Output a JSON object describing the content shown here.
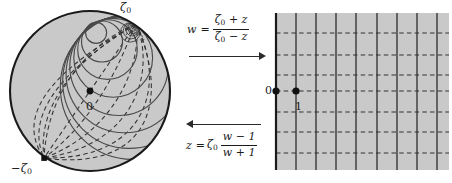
{
  "figure": {
    "background": "#ffffff",
    "width": 452,
    "height": 183
  },
  "colors": {
    "region_fill": "#c9c9c9",
    "boundary_stroke": "#1a1a1a",
    "solid_curve": "#4a4a4a",
    "dashed_curve": "#333333",
    "point_marker": "#111111",
    "text": "#1a1a1a",
    "arrow": "#2b2b2b"
  },
  "disk_panel": {
    "name": "unit-disk",
    "center": {
      "x": 90,
      "y": 91
    },
    "radius": 81,
    "labels": {
      "zeta0": "ζ0",
      "zeta0_base": "ζ",
      "zeta0_sub": "0",
      "neg_zeta0_base": "−ζ",
      "neg_zeta0_sub": "0",
      "origin": "0"
    },
    "points": [
      {
        "name": "origin-point",
        "label": "0",
        "x": 90,
        "y": 91,
        "marker": "dot"
      },
      {
        "name": "zeta0-point",
        "label": "ζ0",
        "x": 136,
        "y": 24,
        "marker": "tangency"
      },
      {
        "name": "neg-zeta0-point",
        "label": "−ζ0",
        "x": 44,
        "y": 158,
        "marker": "square"
      }
    ],
    "solid_circles_note": "images of vertical lines: circles internally tangent to the unit circle at zeta0",
    "dashed_arcs_note": "images of horizontal lines: arcs through zeta0 and -zeta0"
  },
  "halfplane_panel": {
    "name": "right-half-plane",
    "bounds": {
      "left": 276,
      "top": 13,
      "right": 449,
      "bottom": 170
    },
    "axis_line_x": 276,
    "vertical_lines_x": [
      276,
      296,
      316,
      336,
      356,
      377,
      397,
      417,
      437
    ],
    "horizontal_lines_y": [
      33,
      55,
      75,
      91,
      112,
      132,
      153
    ],
    "points": [
      {
        "name": "zero-point",
        "label": "0",
        "x": 276,
        "y": 91
      },
      {
        "name": "one-point",
        "label": "1",
        "x": 296,
        "y": 91
      }
    ],
    "labels": {
      "zero": "0",
      "one": "1"
    },
    "line_styles": {
      "vertical": "solid",
      "horizontal": "dashed"
    }
  },
  "map_panel": {
    "forward": {
      "name": "forward-map-formula",
      "lhs": "w",
      "equals": "=",
      "numerator_base": "ζ",
      "numerator_sub": "0",
      "numerator_rest": "+ z",
      "denominator_base": "ζ",
      "denominator_sub": "0",
      "denominator_rest": "− z",
      "plain": "w = (ζ0 + z)/(ζ0 − z)",
      "arrow": "right"
    },
    "backward": {
      "name": "backward-map-formula",
      "lhs": "z",
      "equals": "=",
      "coefficient_base": "ζ",
      "coefficient_sub": "0",
      "numerator": "w − 1",
      "denominator": "w + 1",
      "plain": "z = ζ0 (w − 1)/(w + 1)",
      "arrow": "left"
    }
  }
}
